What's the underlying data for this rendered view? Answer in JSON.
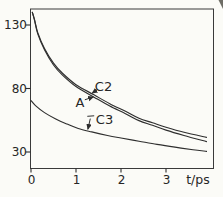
{
  "figure": {
    "background": "#fbfbf7",
    "line_color": "#2e2e2e",
    "text_color": "#262626"
  },
  "chart_data": {
    "type": "line",
    "title": "",
    "xlabel": "t/ps",
    "ylabel": "",
    "xlim": [
      0,
      4.06
    ],
    "ylim": [
      17,
      142.5
    ],
    "xticks": [
      0,
      1,
      2,
      3
    ],
    "yticks": [
      130,
      80,
      30
    ],
    "grid": false,
    "frame": "box",
    "legend_position": "none",
    "series": [
      {
        "name": "C2",
        "x": [
          0.03,
          0.08,
          0.15,
          0.3,
          0.5,
          0.7,
          1.0,
          1.4,
          1.75,
          2.1,
          2.4,
          2.7,
          3.0,
          3.4,
          3.9
        ],
        "y": [
          140,
          134,
          124,
          111.5,
          100,
          92,
          83,
          75,
          68,
          62,
          56.5,
          53,
          49.5,
          45.5,
          41.5
        ]
      },
      {
        "name": "A",
        "x": [
          0.03,
          0.08,
          0.15,
          0.3,
          0.5,
          0.7,
          1.0,
          1.4,
          1.75,
          2.1,
          2.4,
          2.7,
          3.0,
          3.4,
          3.9
        ],
        "y": [
          140,
          133.5,
          123,
          110.5,
          98.5,
          90.5,
          81.5,
          73.2,
          66.2,
          60.2,
          54.7,
          51.0,
          47.2,
          43.0,
          38.2
        ]
      },
      {
        "name": "C3",
        "x": [
          0,
          0.1,
          0.3,
          0.55,
          0.8,
          1.05,
          1.35,
          1.7,
          2.0,
          2.4,
          2.8,
          3.2,
          3.6,
          3.9
        ],
        "y": [
          70.5,
          66.5,
          61,
          56,
          52,
          48.5,
          45.8,
          43,
          41,
          38.5,
          36,
          33.8,
          31.8,
          30.5
        ]
      }
    ],
    "annotations": [
      {
        "label": "C2",
        "text_x": 103.5,
        "text_y": 86,
        "arrow": {
          "x1": 97.3,
          "y1": 89.6,
          "x2": 92.2,
          "y2": 93.1
        }
      },
      {
        "label": "A",
        "text_x": 80,
        "text_y": 102,
        "arrow": {
          "x1": 84.8,
          "y1": 99.8,
          "x2": 93.3,
          "y2": 96.9
        }
      },
      {
        "label": "C3",
        "text_x": 104.5,
        "text_y": 119.5,
        "dash": {
          "x1": 87.3,
          "y1": 116.3,
          "x2": 94.2,
          "y2": 115.8
        },
        "arrow": {
          "x1": 90.3,
          "y1": 118.6,
          "x2": 87.9,
          "y2": 129.2
        }
      }
    ]
  }
}
